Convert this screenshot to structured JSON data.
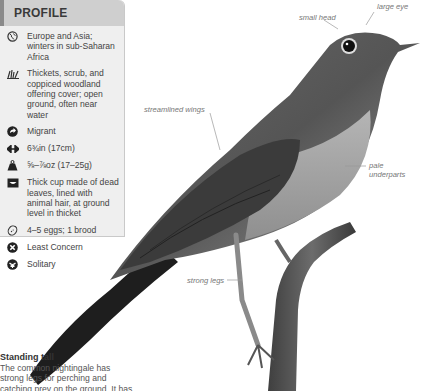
{
  "profile": {
    "title": "PROFILE",
    "items": [
      {
        "icon": "globe-icon",
        "text": "Europe and Asia; winters in sub-Saharan Africa"
      },
      {
        "icon": "grass-habitat-icon",
        "text": "Thickets, scrub, and coppiced woodland offering cover; open ground, often near water"
      },
      {
        "icon": "migration-arrow-icon",
        "text": "Migrant"
      },
      {
        "icon": "length-arrows-icon",
        "text": "6¾in (17cm)"
      },
      {
        "icon": "weight-icon",
        "text": "⅝–⅞oz (17–25g)"
      },
      {
        "icon": "nest-icon",
        "text": "Thick cup made of dead leaves, lined with animal hair, at ground level in thicket"
      },
      {
        "icon": "egg-icon",
        "text": "4–5 eggs; 1 brood"
      },
      {
        "icon": "conservation-x-icon",
        "text": "Least Concern"
      },
      {
        "icon": "social-icon",
        "text": "Solitary"
      }
    ]
  },
  "annotations": {
    "small_head": "small head",
    "large_eye": "large eye",
    "streamlined_wings": "streamlined wings",
    "pale_underparts_1": "pale",
    "pale_underparts_2": "underparts",
    "strong_legs": "strong legs"
  },
  "caption": {
    "title": "Standing tall",
    "line1": "The common nightingale has",
    "line2": "strong legs for perching and",
    "line3": "catching prey on the ground. It has"
  },
  "colors": {
    "panel_bg": "#efefef",
    "header_bg": "#cfcfcf",
    "accent_bar": "#8a8a8a"
  }
}
